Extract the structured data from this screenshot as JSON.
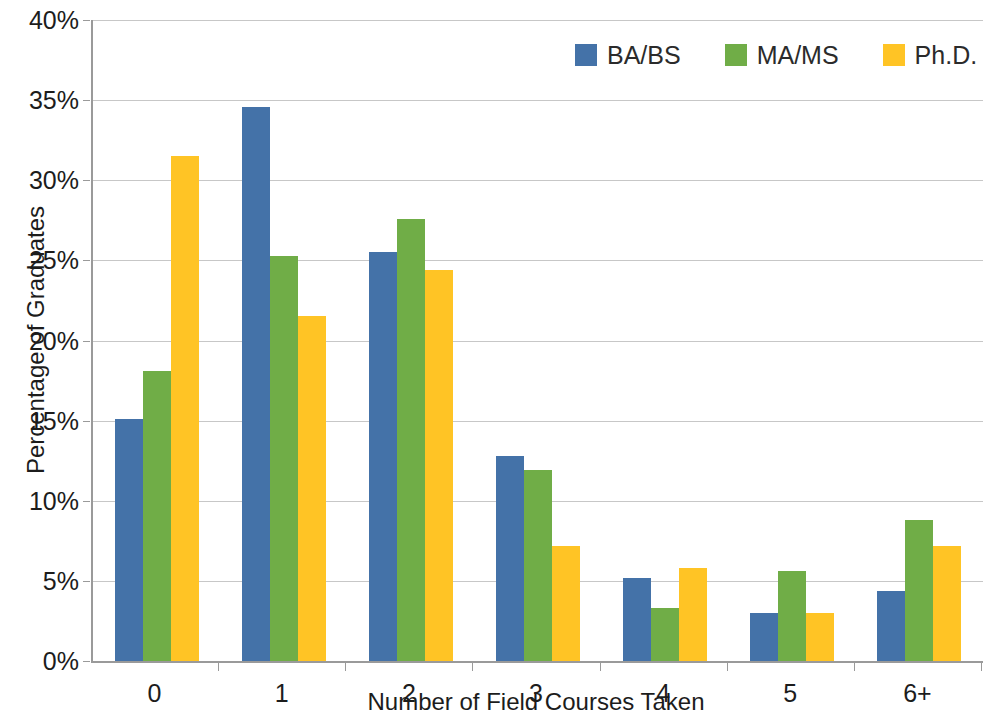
{
  "chart_data": {
    "type": "bar",
    "title": "",
    "xlabel": "Number of Field Courses Taken",
    "ylabel": "Percentage of Graduates",
    "categories": [
      "0",
      "1",
      "2",
      "3",
      "4",
      "5",
      "6+"
    ],
    "ylim": [
      0,
      40
    ],
    "ytick_labels": [
      "0%",
      "5%",
      "10%",
      "15%",
      "20%",
      "25%",
      "30%",
      "35%",
      "40%"
    ],
    "ytick_values": [
      0,
      5,
      10,
      15,
      20,
      25,
      30,
      35,
      40
    ],
    "grid": true,
    "legend_position": "top-right",
    "value_unit": "%",
    "series": [
      {
        "name": "BA/BS",
        "color": "#4472A8",
        "values": [
          15.1,
          34.6,
          25.5,
          12.8,
          5.2,
          3.0,
          4.4
        ]
      },
      {
        "name": "MA/MS",
        "color": "#70AD47",
        "values": [
          18.1,
          25.3,
          27.6,
          11.9,
          3.3,
          5.6,
          8.8
        ]
      },
      {
        "name": "Ph.D.",
        "color": "#FFC425",
        "values": [
          31.5,
          21.5,
          24.4,
          7.2,
          5.8,
          3.0,
          7.2
        ]
      }
    ]
  }
}
